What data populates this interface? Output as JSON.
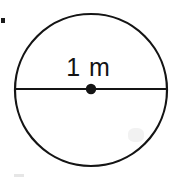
{
  "figure": {
    "background_color": "#ffffff",
    "stroke_color": "#141414",
    "label_color": "#141414"
  },
  "diagram": {
    "shape": "circle",
    "center_dot": {
      "name": "center-point",
      "cx": 91,
      "cy": 89,
      "r": 5.2,
      "fill": "#141414"
    },
    "circle_outline": {
      "cx": 91,
      "cy": 90,
      "r": 76,
      "stroke_width": 2.2,
      "fill": "none"
    },
    "diameter_line": {
      "x1": 15,
      "y1": 89,
      "x2": 167,
      "y2": 89,
      "stroke_width": 2.2
    },
    "measurement": {
      "label": "1 m",
      "value": 1,
      "unit": "m",
      "measures": "diameter"
    }
  },
  "artifacts": {
    "top_left_speck": "ink-speck",
    "bottom_left_smudge": "scan-smudge",
    "interior_smudge": "scan-smudge"
  }
}
